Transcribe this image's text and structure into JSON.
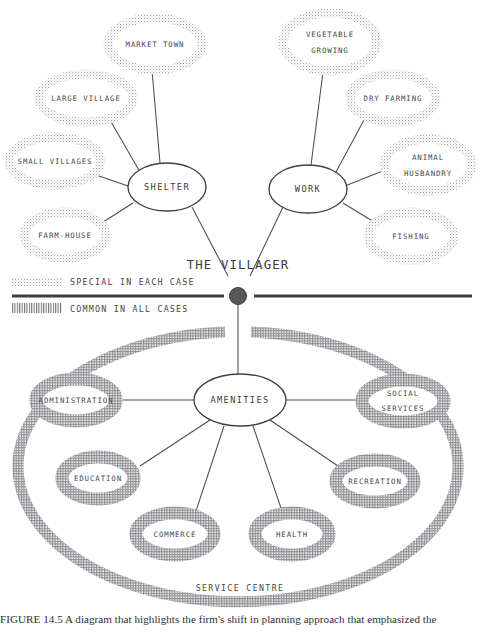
{
  "figure": {
    "caption": "FIGURE 14.5  A diagram that highlights the firm's shift in planning approach that emphasized the",
    "center_label": "THE VILLAGER",
    "colors": {
      "ink": "#3c3d41",
      "line": "#4b4c50",
      "stipple_light": "#b9b9bc",
      "stipple_dense": "#8d8e92",
      "background": "#ffffff"
    }
  },
  "legend": {
    "items": [
      {
        "swatch": "dotted-swatch",
        "label": "SPECIAL IN EACH CASE"
      },
      {
        "swatch": "hatched-swatch",
        "label": "COMMON IN ALL CASES"
      }
    ]
  },
  "clusters": {
    "shelter": {
      "hub_label": "SHELTER",
      "hub": {
        "cx": 167,
        "cy": 187,
        "rx": 39,
        "ry": 24
      },
      "satellites": [
        {
          "label": "MARKET TOWN",
          "lines": [
            "MARKET TOWN"
          ],
          "cx": 155,
          "cy": 44,
          "rx": 47,
          "ry": 26
        },
        {
          "label": "LARGE VILLAGE",
          "lines": [
            "LARGE  VILLAGE"
          ],
          "cx": 86,
          "cy": 98,
          "rx": 47,
          "ry": 24
        },
        {
          "label": "SMALL VILLAGES",
          "lines": [
            "SMALL  VILLAGES"
          ],
          "cx": 55,
          "cy": 161,
          "rx": 46,
          "ry": 24
        },
        {
          "label": "FARM-HOUSE",
          "lines": [
            "FARM-HOUSE"
          ],
          "cx": 65,
          "cy": 235,
          "rx": 41,
          "ry": 23
        }
      ]
    },
    "work": {
      "hub_label": "WORK",
      "hub": {
        "cx": 308,
        "cy": 189,
        "rx": 39,
        "ry": 24
      },
      "satellites": [
        {
          "label": "VEGETABLE GROWING",
          "lines": [
            "VEGETABLE",
            "GROWING"
          ],
          "cx": 330,
          "cy": 42,
          "rx": 47,
          "ry": 29
        },
        {
          "label": "DRY FARMING",
          "lines": [
            "DRY  FARMING"
          ],
          "cx": 393,
          "cy": 98,
          "rx": 43,
          "ry": 24
        },
        {
          "label": "ANIMAL HUSBANDRY",
          "lines": [
            "ANIMAL",
            "HUSBANDRY"
          ],
          "cx": 428,
          "cy": 165,
          "rx": 44,
          "ry": 26
        },
        {
          "label": "FISHING",
          "lines": [
            "FISHING"
          ],
          "cx": 411,
          "cy": 236,
          "rx": 43,
          "ry": 24
        }
      ]
    },
    "amenities": {
      "hub_label": "AMENITIES",
      "hub": {
        "cx": 240,
        "cy": 400,
        "rx": 46,
        "ry": 26
      },
      "ring_label": "SERVICE CENTRE",
      "satellites": [
        {
          "label": "ADMINISTRATION",
          "lines": [
            "ADMINISTRATION"
          ],
          "cx": 76,
          "cy": 400,
          "rx": 47,
          "ry": 25
        },
        {
          "label": "SOCIAL SERVICES",
          "lines": [
            "SOCIAL",
            "SERVICES"
          ],
          "cx": 403,
          "cy": 401,
          "rx": 47,
          "ry": 25
        },
        {
          "label": "EDUCATION",
          "lines": [
            "EDUCATION"
          ],
          "cx": 98,
          "cy": 478,
          "rx": 42,
          "ry": 25
        },
        {
          "label": "RECREATION",
          "lines": [
            "RECREATION"
          ],
          "cx": 375,
          "cy": 481,
          "rx": 45,
          "ry": 25
        },
        {
          "label": "COMMERCE",
          "lines": [
            "COMMERCE"
          ],
          "cx": 175,
          "cy": 534,
          "rx": 45,
          "ry": 25
        },
        {
          "label": "HEALTH",
          "lines": [
            "HEALTH"
          ],
          "cx": 292,
          "cy": 534,
          "rx": 43,
          "ry": 25
        }
      ]
    }
  }
}
